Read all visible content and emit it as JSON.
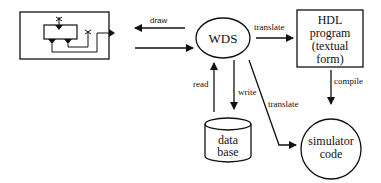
{
  "diagram": {
    "nodes": {
      "schematic": {
        "type": "schematic-editor-box"
      },
      "wds": {
        "label": "WDS"
      },
      "hdl": {
        "lines": [
          "HDL",
          "program",
          "(textual",
          "form)"
        ]
      },
      "database": {
        "lines": [
          "data",
          "base"
        ]
      },
      "simulator": {
        "lines": [
          "simulator",
          "code"
        ]
      }
    },
    "edges": {
      "draw": "draw",
      "translate_hdl": "translate",
      "compile": "compile",
      "read": "read",
      "write": "write",
      "translate_sim": "translate"
    },
    "colors": {
      "stroke": "#111111",
      "background": "#ffffff"
    }
  }
}
